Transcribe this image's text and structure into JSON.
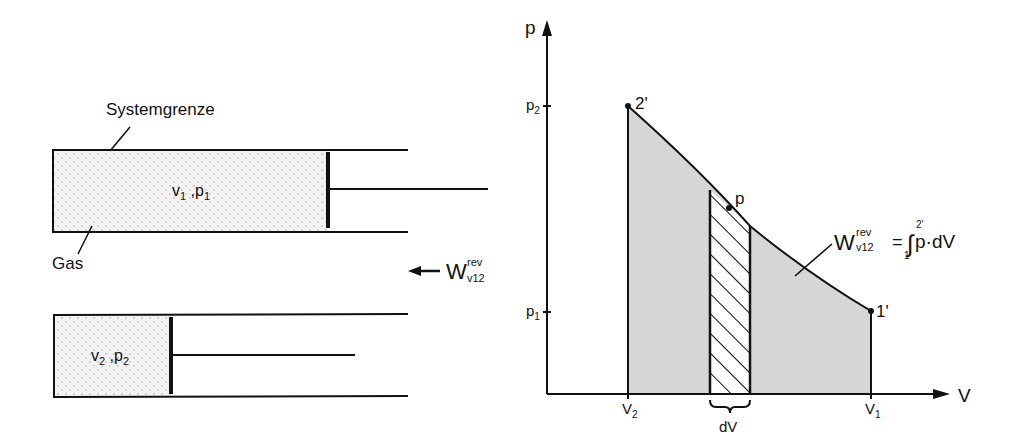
{
  "left_figure": {
    "system_boundary_label": "Systemgrenze",
    "gas_label": "Gas",
    "state1": {
      "v": "v",
      "v_sub": "1",
      "sep": " ,",
      "p": "p",
      "p_sub": "1"
    },
    "state2": {
      "v": "v",
      "v_sub": "2",
      "sep": " ,",
      "p": "p",
      "p_sub": "2"
    },
    "work_label": {
      "W": "W",
      "sup": "rev",
      "sub": "v12"
    }
  },
  "right_figure": {
    "axis_y_label": "p",
    "axis_x_label": "V",
    "y_ticks": [
      {
        "label": "p",
        "sub": "2"
      },
      {
        "label": "p",
        "sub": "1"
      }
    ],
    "x_ticks": [
      {
        "label": "V",
        "sub": "2"
      },
      {
        "label": "V",
        "sub": "1"
      }
    ],
    "point_2": "2'",
    "point_1": "1'",
    "point_p": "p",
    "strip_label": "dV",
    "work_label": {
      "W": "W",
      "sup": "rev",
      "sub": "v12"
    },
    "integral": {
      "eq": "=",
      "sign": "∫",
      "upper": "2'",
      "lower": "1'",
      "integrand": "p·dV"
    }
  },
  "colors": {
    "stroke": "#111111",
    "area_fill": "#d9d9d9",
    "gas_fill": "#f1f1f1",
    "gas_dots": "#c8c8c8"
  }
}
